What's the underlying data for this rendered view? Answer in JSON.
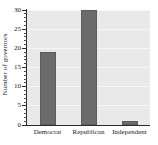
{
  "chart_data": {
    "type": "bar",
    "title": "",
    "subtitle": "",
    "xlabel": "",
    "ylabel": "Number of governors",
    "categories": [
      "Democrat",
      "Republican",
      "Independent"
    ],
    "values": [
      19,
      30,
      1
    ],
    "series": [
      {
        "name": "Number of governors",
        "values": [
          19,
          30,
          1
        ]
      }
    ],
    "ylim": [
      0,
      30
    ],
    "xlim_categories": 3,
    "y_ticks": [
      0,
      5,
      10,
      15,
      20,
      25,
      30
    ],
    "y_tick_labels": [
      "0",
      "5",
      "10",
      "15",
      "20",
      "25",
      "30"
    ],
    "y_minor_tick_interval": 1,
    "grid": {
      "horizontal": true,
      "vertical": false,
      "color": "#f6f6f6"
    },
    "legend": {
      "visible": false,
      "position": "none",
      "entries": []
    },
    "annotations": [],
    "colors": {
      "bar_fill": "#6b6b6b",
      "bar_edge": "#5d5d5d",
      "plot_background": "#e9e9e9",
      "figure_background": "#ffffff",
      "axis": "#2b2b2b",
      "text": "#1a1a1a"
    }
  }
}
